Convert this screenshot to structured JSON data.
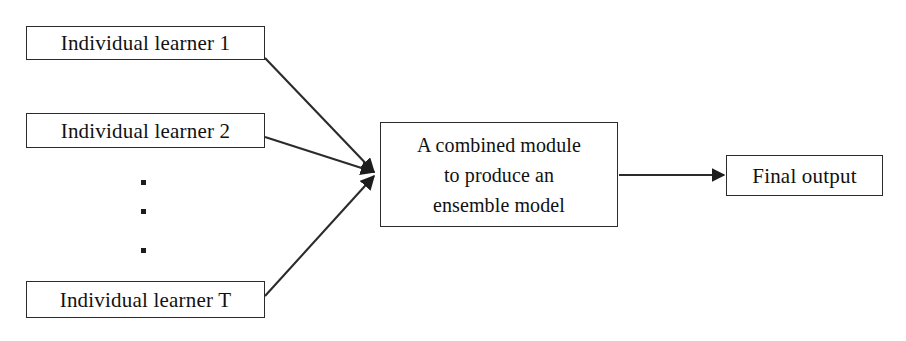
{
  "diagram": {
    "background_color": "#ffffff",
    "line_color": "#2b2b2b",
    "text_color": "#111111",
    "nodes": {
      "learner_1": {
        "label": "Individual learner 1"
      },
      "learner_2": {
        "label": "Individual learner 2"
      },
      "learner_t": {
        "label": "Individual learner T"
      },
      "combiner": {
        "label": "A combined module\nto produce an\nensemble model"
      },
      "output": {
        "label": "Final output"
      }
    },
    "ellipsis": {
      "name": "vertical-ellipsis",
      "dots": ".\n.\n.",
      "meaning": "additional individual learners between 2 and T"
    },
    "edges": [
      {
        "name": "learner-1-to-combiner",
        "from": "learner_1",
        "to": "combiner",
        "arrowhead": true
      },
      {
        "name": "learner-2-to-combiner",
        "from": "learner_2",
        "to": "combiner",
        "arrowhead": true
      },
      {
        "name": "learner-t-to-combiner",
        "from": "learner_t",
        "to": "combiner",
        "arrowhead": true
      },
      {
        "name": "combiner-to-output",
        "from": "combiner",
        "to": "output",
        "arrowhead": true
      }
    ]
  }
}
